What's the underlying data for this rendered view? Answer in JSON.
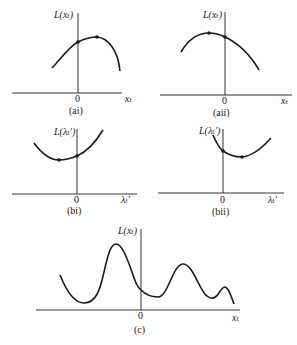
{
  "panels": [
    {
      "id": "ai",
      "caption": "(ai)",
      "y_label": "L(xₜ)",
      "x_label": "xₜ",
      "origin_label": "0",
      "curve_shape": "concave, maximum to the right of origin",
      "marked_points": [
        "intercept at origin",
        "maximum"
      ]
    },
    {
      "id": "aii",
      "caption": "(aii)",
      "y_label": "L(xₜ)",
      "x_label": "xₜ",
      "origin_label": "0",
      "curve_shape": "concave, maximum to the left of origin",
      "marked_points": [
        "maximum",
        "intercept at origin"
      ]
    },
    {
      "id": "bi",
      "caption": "(bi)",
      "y_label": "L(λₜ′)",
      "x_label": "λₜ′",
      "origin_label": "0",
      "curve_shape": "convex, minimum to the left of origin",
      "marked_points": [
        "minimum",
        "intercept at origin"
      ]
    },
    {
      "id": "bii",
      "caption": "(bii)",
      "y_label": "L(λₜ′)",
      "x_label": "λₜ′",
      "origin_label": "0",
      "curve_shape": "convex, minimum to the right of origin",
      "marked_points": [
        "intercept at origin",
        "minimum"
      ]
    },
    {
      "id": "c",
      "caption": "(c)",
      "y_label": "L(xₜ)",
      "x_label": "xₜ",
      "origin_label": "0",
      "curve_shape": "multimodal with several local maxima and minima"
    }
  ]
}
